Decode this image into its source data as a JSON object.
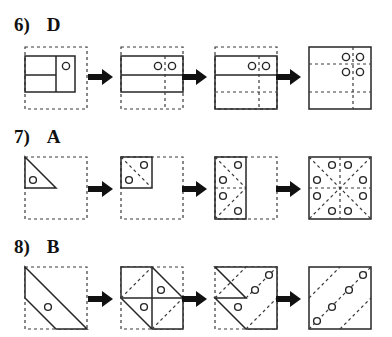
{
  "page": {
    "background": "#ffffff",
    "ink": "#1a1a1a",
    "width": 392,
    "height": 337
  },
  "style": {
    "solid_stroke": "#262626",
    "dashed_stroke": "#3a3a3a",
    "arrow_fill": "#111111",
    "circle_fill": "#ffffff",
    "panel_size": 62,
    "dash_pattern": "3,3"
  },
  "rows": [
    {
      "id": "row-6",
      "number": "6)",
      "answer": "D",
      "label_top": 14,
      "panels_top": 44,
      "panels": [
        {
          "name": "panel-6-1",
          "left": 22,
          "stage": "folded",
          "outer": "dashed-square",
          "shapes": [
            {
              "type": "rect",
              "style": "solid",
              "x": 0,
              "y": 9,
              "w": 50,
              "h": 36
            },
            {
              "type": "line",
              "style": "solid",
              "x1": 31,
              "y1": 9,
              "x2": 31,
              "y2": 45
            },
            {
              "type": "line",
              "style": "solid",
              "x1": 0,
              "y1": 28,
              "x2": 31,
              "y2": 28
            }
          ],
          "holes": [
            {
              "cx": 41,
              "cy": 19,
              "r": 3.6
            }
          ]
        },
        {
          "name": "panel-6-2",
          "left": 118,
          "stage": "unfold-1",
          "outer": "dashed-square",
          "shapes": [
            {
              "type": "rect",
              "style": "solid",
              "x": 0,
              "y": 9,
              "w": 62,
              "h": 36
            },
            {
              "type": "line",
              "style": "solid",
              "x1": 0,
              "y1": 28,
              "x2": 62,
              "y2": 28
            },
            {
              "type": "line",
              "style": "dashed",
              "x1": 44,
              "y1": 9,
              "x2": 44,
              "y2": 62
            }
          ],
          "holes": [
            {
              "cx": 37,
              "cy": 19,
              "r": 3.6
            },
            {
              "cx": 51,
              "cy": 19,
              "r": 3.6
            }
          ]
        },
        {
          "name": "panel-6-3",
          "left": 212,
          "stage": "unfold-2",
          "outer": "dashed-square",
          "shapes": [
            {
              "type": "rect",
              "style": "solid",
              "x": 0,
              "y": 9,
              "w": 62,
              "h": 53
            },
            {
              "type": "line",
              "style": "solid",
              "x1": 0,
              "y1": 28,
              "x2": 62,
              "y2": 28
            },
            {
              "type": "line",
              "style": "dashed",
              "x1": 0,
              "y1": 45,
              "x2": 62,
              "y2": 45
            },
            {
              "type": "line",
              "style": "dashed",
              "x1": 44,
              "y1": 9,
              "x2": 44,
              "y2": 62
            }
          ],
          "holes": [
            {
              "cx": 37,
              "cy": 19,
              "r": 3.6
            },
            {
              "cx": 51,
              "cy": 19,
              "r": 3.6
            }
          ]
        },
        {
          "name": "panel-6-4",
          "left": 306,
          "stage": "unfolded-final",
          "outer": "solid-square",
          "shapes": [
            {
              "type": "line",
              "style": "dashed",
              "x1": 0,
              "y1": 17,
              "x2": 62,
              "y2": 17
            },
            {
              "type": "line",
              "style": "dashed",
              "x1": 0,
              "y1": 45,
              "x2": 62,
              "y2": 45
            },
            {
              "type": "line",
              "style": "dashed",
              "x1": 44,
              "y1": 0,
              "x2": 44,
              "y2": 62
            }
          ],
          "holes": [
            {
              "cx": 37,
              "cy": 10,
              "r": 3.6
            },
            {
              "cx": 51,
              "cy": 10,
              "r": 3.6
            },
            {
              "cx": 37,
              "cy": 25,
              "r": 3.6
            },
            {
              "cx": 51,
              "cy": 25,
              "r": 3.6
            }
          ]
        }
      ],
      "arrows": [
        {
          "name": "arrow-6-1",
          "left": 88,
          "top": 68
        },
        {
          "name": "arrow-6-2",
          "left": 182,
          "top": 68
        },
        {
          "name": "arrow-6-3",
          "left": 276,
          "top": 68
        }
      ]
    },
    {
      "id": "row-7",
      "number": "7)",
      "answer": "A",
      "label_top": 126,
      "panels_top": 154,
      "panels": [
        {
          "name": "panel-7-1",
          "left": 22,
          "stage": "folded",
          "outer": "dashed-square",
          "shapes": [
            {
              "type": "poly",
              "style": "solid",
              "points": "0,0 31,31 0,31"
            }
          ],
          "holes": [
            {
              "cx": 8,
              "cy": 23,
              "r": 3.4
            }
          ]
        },
        {
          "name": "panel-7-2",
          "left": 118,
          "stage": "unfold-1",
          "outer": "dashed-square",
          "shapes": [
            {
              "type": "rect",
              "style": "solid",
              "x": 0,
              "y": 0,
              "w": 31,
              "h": 31
            },
            {
              "type": "line",
              "style": "dashed",
              "x1": 0,
              "y1": 0,
              "x2": 31,
              "y2": 31
            }
          ],
          "holes": [
            {
              "cx": 8,
              "cy": 23,
              "r": 3.4
            },
            {
              "cx": 23,
              "cy": 8,
              "r": 3.4
            }
          ]
        },
        {
          "name": "panel-7-3",
          "left": 212,
          "stage": "unfold-2",
          "outer": "dashed-square",
          "shapes": [
            {
              "type": "rect",
              "style": "solid",
              "x": 0,
              "y": 0,
              "w": 31,
              "h": 62
            },
            {
              "type": "line",
              "style": "dashed",
              "x1": 0,
              "y1": 0,
              "x2": 31,
              "y2": 31
            },
            {
              "type": "line",
              "style": "dashed",
              "x1": 0,
              "y1": 62,
              "x2": 31,
              "y2": 31
            },
            {
              "type": "line",
              "style": "dashed",
              "x1": 0,
              "y1": 31,
              "x2": 31,
              "y2": 31
            }
          ],
          "holes": [
            {
              "cx": 8,
              "cy": 23,
              "r": 3.4
            },
            {
              "cx": 23,
              "cy": 8,
              "r": 3.4
            },
            {
              "cx": 8,
              "cy": 39,
              "r": 3.4
            },
            {
              "cx": 23,
              "cy": 54,
              "r": 3.4
            }
          ]
        },
        {
          "name": "panel-7-4",
          "left": 306,
          "stage": "unfolded-final",
          "outer": "solid-square",
          "shapes": [
            {
              "type": "line",
              "style": "dashed",
              "x1": 0,
              "y1": 0,
              "x2": 62,
              "y2": 62
            },
            {
              "type": "line",
              "style": "dashed",
              "x1": 62,
              "y1": 0,
              "x2": 0,
              "y2": 62
            },
            {
              "type": "line",
              "style": "dashed",
              "x1": 0,
              "y1": 31,
              "x2": 62,
              "y2": 31
            },
            {
              "type": "line",
              "style": "dashed",
              "x1": 31,
              "y1": 0,
              "x2": 31,
              "y2": 62
            }
          ],
          "holes": [
            {
              "cx": 23,
              "cy": 8,
              "r": 3.4
            },
            {
              "cx": 39,
              "cy": 8,
              "r": 3.4
            },
            {
              "cx": 8,
              "cy": 23,
              "r": 3.4
            },
            {
              "cx": 54,
              "cy": 23,
              "r": 3.4
            },
            {
              "cx": 8,
              "cy": 39,
              "r": 3.4
            },
            {
              "cx": 54,
              "cy": 39,
              "r": 3.4
            },
            {
              "cx": 23,
              "cy": 54,
              "r": 3.4
            },
            {
              "cx": 39,
              "cy": 54,
              "r": 3.4
            }
          ]
        }
      ],
      "arrows": [
        {
          "name": "arrow-7-1",
          "left": 88,
          "top": 180
        },
        {
          "name": "arrow-7-2",
          "left": 182,
          "top": 180
        },
        {
          "name": "arrow-7-3",
          "left": 276,
          "top": 180
        }
      ]
    },
    {
      "id": "row-8",
      "number": "8)",
      "answer": "B",
      "label_top": 236,
      "panels_top": 264,
      "panels": [
        {
          "name": "panel-8-1",
          "left": 22,
          "stage": "folded",
          "outer": "dashed-square",
          "shapes": [
            {
              "type": "poly",
              "style": "solid",
              "points": "0,0 62,62 31,62 0,31"
            }
          ],
          "holes": [
            {
              "cx": 23,
              "cy": 40,
              "r": 3.4
            }
          ]
        },
        {
          "name": "panel-8-2",
          "left": 118,
          "stage": "unfold-1",
          "outer": "dashed-square",
          "shapes": [
            {
              "type": "poly",
              "style": "solid",
              "points": "0,0 31,0 62,31 62,62 31,62 0,31"
            },
            {
              "type": "line",
              "style": "solid",
              "x1": 0,
              "y1": 31,
              "x2": 62,
              "y2": 31
            },
            {
              "type": "line",
              "style": "solid",
              "x1": 31,
              "y1": 0,
              "x2": 31,
              "y2": 62
            },
            {
              "type": "line",
              "style": "dashed",
              "x1": 0,
              "y1": 31,
              "x2": 31,
              "y2": 0
            },
            {
              "type": "line",
              "style": "dashed",
              "x1": 31,
              "y1": 62,
              "x2": 62,
              "y2": 31
            }
          ],
          "holes": [
            {
              "cx": 23,
              "cy": 40,
              "r": 3.4
            },
            {
              "cx": 40,
              "cy": 23,
              "r": 3.4
            }
          ]
        },
        {
          "name": "panel-8-3",
          "left": 212,
          "stage": "unfold-2",
          "outer": "dashed-square",
          "shapes": [
            {
              "type": "poly",
              "style": "solid",
              "points": "0,0 62,0 62,62 31,62 0,31 31,31 31,31"
            },
            {
              "type": "line",
              "style": "dashed",
              "x1": 0,
              "y1": 31,
              "x2": 31,
              "y2": 0
            },
            {
              "type": "line",
              "style": "dashed",
              "x1": 31,
              "y1": 31,
              "x2": 62,
              "y2": 0
            },
            {
              "type": "line",
              "style": "dashed",
              "x1": 31,
              "y1": 62,
              "x2": 62,
              "y2": 31
            }
          ],
          "holes": [
            {
              "cx": 23,
              "cy": 40,
              "r": 3.4
            },
            {
              "cx": 40,
              "cy": 23,
              "r": 3.4
            },
            {
              "cx": 54,
              "cy": 8,
              "r": 3.4
            }
          ]
        },
        {
          "name": "panel-8-4",
          "left": 306,
          "stage": "unfolded-final",
          "outer": "solid-square",
          "shapes": [
            {
              "type": "line",
              "style": "dashed",
              "x1": 0,
              "y1": 31,
              "x2": 31,
              "y2": 0
            },
            {
              "type": "line",
              "style": "dashed",
              "x1": 0,
              "y1": 62,
              "x2": 62,
              "y2": 0
            },
            {
              "type": "line",
              "style": "dashed",
              "x1": 31,
              "y1": 62,
              "x2": 62,
              "y2": 31
            }
          ],
          "holes": [
            {
              "cx": 8,
              "cy": 54,
              "r": 3.4
            },
            {
              "cx": 23,
              "cy": 40,
              "r": 3.4
            },
            {
              "cx": 40,
              "cy": 23,
              "r": 3.4
            },
            {
              "cx": 54,
              "cy": 8,
              "r": 3.4
            }
          ]
        }
      ],
      "arrows": [
        {
          "name": "arrow-8-1",
          "left": 88,
          "top": 290
        },
        {
          "name": "arrow-8-2",
          "left": 182,
          "top": 290
        },
        {
          "name": "arrow-8-3",
          "left": 276,
          "top": 290
        }
      ]
    }
  ]
}
